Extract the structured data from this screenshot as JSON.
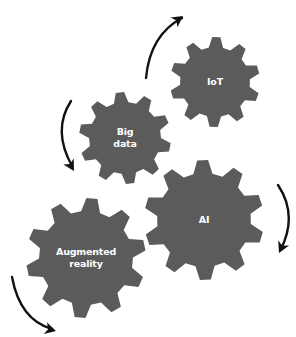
{
  "diagram": {
    "gear_color": "#5b5b5b",
    "arrow_color": "#111111",
    "label_color": "#ffffff",
    "gears": [
      {
        "id": "iot",
        "label": "IoT",
        "cx": 215,
        "cy": 82,
        "r_outer": 45,
        "r_inner": 35,
        "teeth": 10,
        "rotation": 8
      },
      {
        "id": "big-data",
        "label": "Big\ndata",
        "cx": 125,
        "cy": 138,
        "r_outer": 46,
        "r_inner": 36,
        "teeth": 10,
        "rotation": 0
      },
      {
        "id": "ai",
        "label": "AI",
        "cx": 204,
        "cy": 220,
        "r_outer": 60,
        "r_inner": 47,
        "teeth": 10,
        "rotation": 5
      },
      {
        "id": "augmented-reality",
        "label": "Augmented\nreality",
        "cx": 86,
        "cy": 258,
        "r_outer": 60,
        "r_inner": 47,
        "teeth": 10,
        "rotation": 12
      }
    ],
    "arrows": [
      {
        "id": "arrow-top",
        "direction": "clockwise",
        "path": "M146 78 Q150 35 182 18",
        "head": [
          183,
          16
        ],
        "angle": -35
      },
      {
        "id": "arrow-left",
        "direction": "counterclockwise",
        "path": "M71 101 Q52 130 72 166",
        "head": [
          74,
          171
        ],
        "angle": 60
      },
      {
        "id": "arrow-right",
        "direction": "clockwise",
        "path": "M278 185 Q298 215 281 249",
        "head": [
          279,
          253
        ],
        "angle": 115
      },
      {
        "id": "arrow-bottom",
        "direction": "counterclockwise",
        "path": "M12 277 Q20 320 52 329",
        "head": [
          56,
          331
        ],
        "angle": 15
      }
    ]
  }
}
